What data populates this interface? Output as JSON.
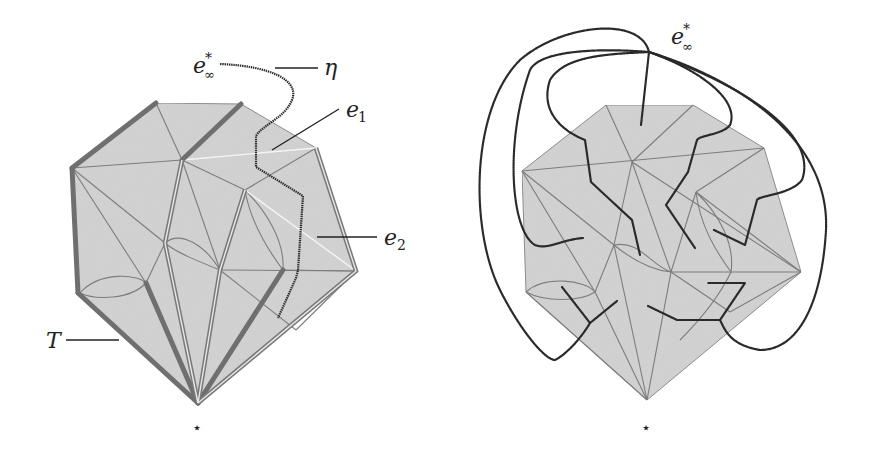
{
  "figure": {
    "panels": [
      {
        "id": "left",
        "labels": {
          "e_inf": "e",
          "e_inf_sub": "∞",
          "e_inf_sup": "*",
          "eta": "η",
          "e1": "e",
          "e1_sub": "1",
          "e2": "e",
          "e2_sub": "2",
          "T": "T",
          "star": "⋆"
        }
      },
      {
        "id": "right",
        "labels": {
          "e_inf": "e",
          "e_inf_sub": "∞",
          "e_inf_sup": "*",
          "star": "⋆"
        }
      }
    ],
    "colors": {
      "fill": "#d2d2d2",
      "edge": "#7a7a7a",
      "tree": "#6f6f6f",
      "dual": "#2a2a2a",
      "highlight": "#f5f5f5"
    }
  }
}
